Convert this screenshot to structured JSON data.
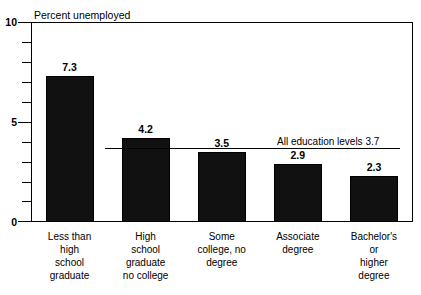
{
  "chart_data": {
    "type": "bar",
    "title": "Percent unemployed",
    "xlabel": "",
    "ylabel": "Percent unemployed",
    "categories": [
      "Less than\nhigh\nschool\ngraduate",
      "High\nschool\ngraduate\nno college",
      "Some\ncollege, no\ndegree",
      "Associate\ndegree",
      "Bachelor's\nor\nhigher\ndegree"
    ],
    "values": [
      7.3,
      4.2,
      3.5,
      2.9,
      2.3
    ],
    "value_labels": [
      "7.3",
      "4.2",
      "3.5",
      "2.9",
      "2.3"
    ],
    "ylim": [
      0,
      10
    ],
    "ytick_labels": [
      "0",
      "5",
      "10"
    ],
    "ytick_values": [
      0,
      5,
      10
    ],
    "minor_tick_values": [
      1,
      2,
      3,
      4,
      6,
      7,
      8,
      9
    ],
    "grid": false,
    "legend": "none",
    "bar_color": "#111111",
    "reference_line": {
      "value": 3.7,
      "label": "All education levels 3.7"
    }
  },
  "axis": {
    "title": "Percent unemployed"
  }
}
